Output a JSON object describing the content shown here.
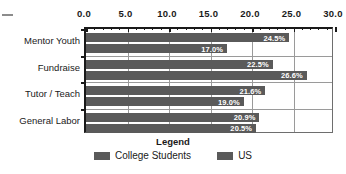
{
  "chart_data": {
    "type": "bar",
    "orientation": "horizontal",
    "title": "",
    "xlabel": "",
    "ylabel": "",
    "categories": [
      "Mentor Youth",
      "Fundraise",
      "Tutor / Teach",
      "General Labor"
    ],
    "series": [
      {
        "name": "College Students",
        "values": [
          24.5,
          22.5,
          21.6,
          20.9
        ],
        "labels": [
          "24.5%",
          "22.5%",
          "21.6%",
          "20.9%"
        ],
        "color": "#5a5a5a"
      },
      {
        "name": "US",
        "values": [
          17.0,
          26.6,
          19.0,
          20.5
        ],
        "labels": [
          "17.0%",
          "26.6%",
          "19.0%",
          "20.5%"
        ],
        "color": "#5a5a5a"
      }
    ],
    "xlim": [
      0.0,
      30.0
    ],
    "xticks": [
      0.0,
      5.0,
      10.0,
      15.0,
      20.0,
      25.0,
      30.0
    ],
    "xtick_labels": [
      "0.0",
      "5.0",
      "10.0",
      "15.0",
      "20.0",
      "25.0",
      "30.0"
    ],
    "xtick_minor_step": 1.0,
    "xaxis_position": "top",
    "grid": "vertical-and-category-separators",
    "legend": {
      "position": "bottom",
      "title": "Legend",
      "entries": [
        "College Students",
        "US"
      ]
    }
  },
  "colors": {
    "bar": "#5a5a5a",
    "axis": "#1a1a1a",
    "grid": "#9a9a9a",
    "background": "#ffffff",
    "bar_label_text": "#ffffff"
  }
}
